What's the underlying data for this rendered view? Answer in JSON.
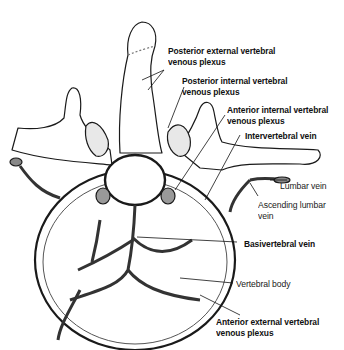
{
  "figure": {
    "labels": [
      {
        "id": "posterior-external",
        "line1": "Posterior external vertebral",
        "line2": "venous plexus",
        "bold": true
      },
      {
        "id": "posterior-internal",
        "line1": "Posterior internal vertebral",
        "line2": "venous plexus",
        "bold": true
      },
      {
        "id": "anterior-internal",
        "line1": "Anterior internal vertebral",
        "line2": "venous plexus",
        "bold": true
      },
      {
        "id": "intervertebral-vein",
        "line1": "Intervertebral vein",
        "bold": true
      },
      {
        "id": "lumbar-vein",
        "line1": "Lumbar vein",
        "bold": false
      },
      {
        "id": "ascending-lumbar-vein",
        "line1": "Ascending lumbar",
        "line2": "vein",
        "bold": false
      },
      {
        "id": "basivertebral-vein",
        "line1": "Basivertebral vein",
        "bold": true
      },
      {
        "id": "vertebral-body",
        "line1": "Vertebral body",
        "bold": false
      },
      {
        "id": "anterior-external",
        "line1": "Anterior external vertebral",
        "line2": "venous plexus",
        "bold": true
      }
    ]
  },
  "colors": {
    "ink": "#1a1a1a",
    "vein": "#555555",
    "bone": "#ffffff",
    "hatch": "#777777"
  }
}
